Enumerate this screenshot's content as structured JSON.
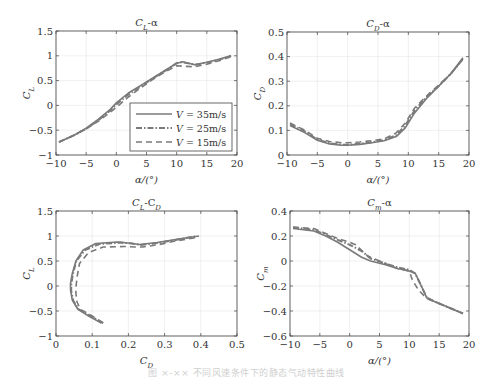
{
  "caption": "图 ×-××  不同风速条件下的静态气动特性曲线",
  "legend": {
    "entries": [
      {
        "label": "V = 35m/s",
        "style": "solid"
      },
      {
        "label": "V = 25m/s",
        "style": "dashdot"
      },
      {
        "label": "V = 15m/s",
        "style": "dashed"
      }
    ]
  },
  "colors": {
    "line": "#7a7a7a",
    "axis": "#444444",
    "grid": "#e6e6e6"
  },
  "chart_data": [
    {
      "id": "cl-alpha",
      "type": "line",
      "title": "C_L-α",
      "xlabel": "α/(°)",
      "ylabel": "C_L",
      "xlim": [
        -10,
        20
      ],
      "ylim": [
        -1,
        1.5
      ],
      "xticks": [
        -10,
        -5,
        0,
        5,
        10,
        15,
        20
      ],
      "yticks": [
        -1,
        -0.5,
        0,
        0.5,
        1,
        1.5
      ],
      "grid": true,
      "legend_position": "lower right",
      "box": {
        "left": 56,
        "top": 31,
        "right": 237,
        "bottom": 155
      },
      "series": [
        {
          "name": "V=35m/s",
          "style": "solid",
          "x": [
            -9.5,
            -7,
            -5,
            -3,
            -1,
            0,
            2,
            4,
            6,
            8,
            10,
            11,
            13,
            15,
            17,
            19
          ],
          "y": [
            -0.74,
            -0.6,
            -0.46,
            -0.28,
            -0.08,
            0.05,
            0.25,
            0.4,
            0.55,
            0.7,
            0.85,
            0.88,
            0.82,
            0.87,
            0.93,
            1.0
          ]
        },
        {
          "name": "V=25m/s",
          "style": "dashdot",
          "x": [
            -9.5,
            -7,
            -5,
            -3,
            -1,
            0,
            2,
            4,
            6,
            8,
            10,
            11,
            13,
            15,
            17,
            19
          ],
          "y": [
            -0.74,
            -0.6,
            -0.47,
            -0.3,
            -0.1,
            0.02,
            0.22,
            0.38,
            0.54,
            0.69,
            0.85,
            0.87,
            0.82,
            0.86,
            0.92,
            1.0
          ]
        },
        {
          "name": "V=15m/s",
          "style": "dashed",
          "x": [
            -9.5,
            -7,
            -5,
            -3,
            -1,
            0,
            2,
            4,
            6,
            8,
            10,
            11,
            13,
            15,
            17,
            19
          ],
          "y": [
            -0.74,
            -0.6,
            -0.47,
            -0.32,
            -0.14,
            -0.04,
            0.17,
            0.35,
            0.52,
            0.67,
            0.8,
            0.79,
            0.78,
            0.83,
            0.9,
            0.98
          ]
        }
      ]
    },
    {
      "id": "cd-alpha",
      "type": "line",
      "title": "C_D-α",
      "xlabel": "α/(°)",
      "ylabel": "C_D",
      "xlim": [
        -10,
        20
      ],
      "ylim": [
        0,
        0.5
      ],
      "xticks": [
        -10,
        -5,
        0,
        5,
        10,
        15,
        20
      ],
      "yticks": [
        0,
        0.1,
        0.2,
        0.3,
        0.4,
        0.5
      ],
      "grid": true,
      "box": {
        "left": 287,
        "top": 32,
        "right": 469,
        "bottom": 155
      },
      "series": [
        {
          "name": "V=35m/s",
          "style": "solid",
          "x": [
            -9.5,
            -7,
            -5,
            -3,
            -1,
            0,
            2,
            4,
            6,
            8,
            9.5,
            11,
            13,
            15,
            17,
            19
          ],
          "y": [
            0.12,
            0.09,
            0.06,
            0.045,
            0.04,
            0.04,
            0.043,
            0.05,
            0.058,
            0.075,
            0.11,
            0.17,
            0.23,
            0.28,
            0.33,
            0.395
          ]
        },
        {
          "name": "V=25m/s",
          "style": "dashdot",
          "x": [
            -9.5,
            -7,
            -5,
            -3,
            -1,
            0,
            2,
            4,
            6,
            8,
            9.5,
            11,
            13,
            15,
            17,
            19
          ],
          "y": [
            0.125,
            0.095,
            0.063,
            0.048,
            0.042,
            0.042,
            0.046,
            0.052,
            0.06,
            0.08,
            0.12,
            0.18,
            0.235,
            0.28,
            0.33,
            0.39
          ]
        },
        {
          "name": "V=15m/s",
          "style": "dashed",
          "x": [
            -9.5,
            -7,
            -5,
            -3,
            -1,
            0,
            2,
            4,
            6,
            8,
            9.5,
            11,
            13,
            15,
            17,
            19
          ],
          "y": [
            0.13,
            0.1,
            0.068,
            0.055,
            0.05,
            0.05,
            0.053,
            0.058,
            0.065,
            0.09,
            0.13,
            0.19,
            0.24,
            0.285,
            0.33,
            0.39
          ]
        }
      ]
    },
    {
      "id": "cl-cd",
      "type": "line",
      "title": "C_L-C_D",
      "xlabel": "C_D",
      "ylabel": "C_L",
      "xlim": [
        0,
        0.5
      ],
      "ylim": [
        -1,
        1.5
      ],
      "xticks": [
        0,
        0.1,
        0.2,
        0.3,
        0.4,
        0.5
      ],
      "yticks": [
        -1,
        -0.5,
        0,
        0.5,
        1,
        1.5
      ],
      "grid": true,
      "box": {
        "left": 56,
        "top": 211,
        "right": 237,
        "bottom": 336
      },
      "series": [
        {
          "name": "V=35m/s",
          "style": "solid",
          "x": [
            0.125,
            0.09,
            0.06,
            0.045,
            0.04,
            0.04,
            0.045,
            0.055,
            0.075,
            0.11,
            0.17,
            0.2,
            0.23,
            0.28,
            0.33,
            0.395
          ],
          "y": [
            -0.74,
            -0.6,
            -0.46,
            -0.28,
            -0.08,
            0.05,
            0.25,
            0.5,
            0.72,
            0.85,
            0.88,
            0.86,
            0.83,
            0.87,
            0.93,
            1.0
          ]
        },
        {
          "name": "V=25m/s",
          "style": "dashdot",
          "x": [
            0.13,
            0.095,
            0.063,
            0.048,
            0.042,
            0.042,
            0.046,
            0.056,
            0.08,
            0.12,
            0.18,
            0.21,
            0.235,
            0.28,
            0.33,
            0.39
          ],
          "y": [
            -0.74,
            -0.6,
            -0.47,
            -0.3,
            -0.1,
            0.02,
            0.22,
            0.5,
            0.72,
            0.84,
            0.87,
            0.85,
            0.82,
            0.86,
            0.92,
            1.0
          ]
        },
        {
          "name": "V=15m/s",
          "style": "dashed",
          "x": [
            0.13,
            0.1,
            0.068,
            0.058,
            0.055,
            0.055,
            0.058,
            0.065,
            0.09,
            0.13,
            0.19,
            0.22,
            0.24,
            0.285,
            0.33,
            0.395
          ],
          "y": [
            -0.74,
            -0.6,
            -0.47,
            -0.32,
            -0.14,
            -0.04,
            0.17,
            0.45,
            0.67,
            0.78,
            0.79,
            0.78,
            0.78,
            0.83,
            0.9,
            0.98
          ]
        }
      ]
    },
    {
      "id": "cm-alpha",
      "type": "line",
      "title": "C_m-α",
      "xlabel": "α/(°)",
      "ylabel": "C_m",
      "xlim": [
        -10,
        20
      ],
      "ylim": [
        -0.6,
        0.4
      ],
      "xticks": [
        -10,
        -5,
        0,
        5,
        10,
        15,
        20
      ],
      "yticks": [
        -0.6,
        -0.4,
        -0.2,
        0,
        0.2,
        0.4
      ],
      "grid": true,
      "box": {
        "left": 290,
        "top": 211,
        "right": 469,
        "bottom": 336
      },
      "series": [
        {
          "name": "V=35m/s",
          "style": "solid",
          "x": [
            -9.5,
            -6,
            -4,
            -2,
            0,
            2,
            3.5,
            6,
            8,
            10,
            11,
            12,
            13,
            15,
            17,
            19
          ],
          "y": [
            0.26,
            0.24,
            0.2,
            0.15,
            0.09,
            0.03,
            0.0,
            -0.03,
            -0.06,
            -0.08,
            -0.1,
            -0.2,
            -0.3,
            -0.34,
            -0.38,
            -0.42
          ]
        },
        {
          "name": "V=25m/s",
          "style": "dashdot",
          "x": [
            -9.5,
            -6,
            -4,
            -2,
            0,
            2,
            3.5,
            6,
            8,
            10,
            11,
            12,
            13,
            15,
            17,
            19
          ],
          "y": [
            0.27,
            0.25,
            0.21,
            0.17,
            0.13,
            0.08,
            0.02,
            -0.02,
            -0.05,
            -0.07,
            -0.1,
            -0.2,
            -0.3,
            -0.34,
            -0.38,
            -0.42
          ]
        },
        {
          "name": "V=15m/s",
          "style": "dashed",
          "x": [
            -9.5,
            -6,
            -4,
            -2,
            0,
            1,
            3,
            5,
            8,
            10,
            10.5,
            11.5,
            12.5,
            15,
            17,
            19
          ],
          "y": [
            0.27,
            0.26,
            0.22,
            0.18,
            0.15,
            0.13,
            0.04,
            0.0,
            -0.06,
            -0.08,
            -0.15,
            -0.23,
            -0.28,
            -0.34,
            -0.38,
            -0.42
          ]
        }
      ]
    }
  ]
}
